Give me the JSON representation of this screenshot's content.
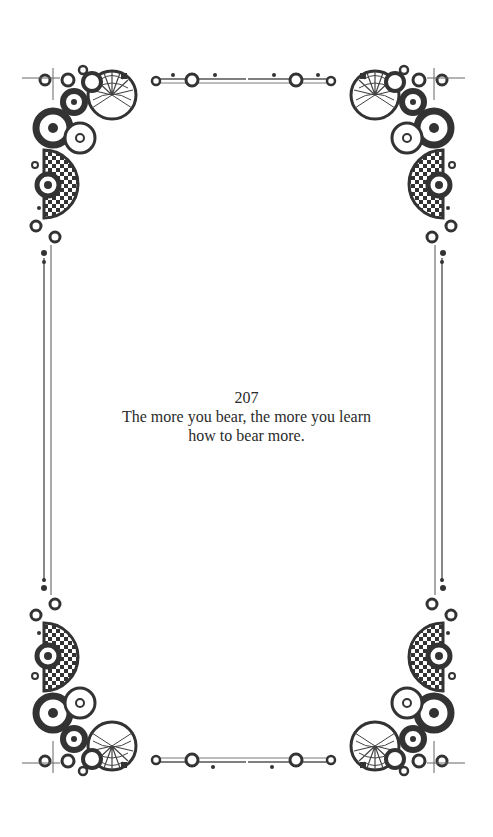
{
  "page": {
    "number": "207",
    "quote_lines": [
      "The more you bear, the more you learn",
      "how to bear more."
    ]
  },
  "frame": {
    "style": "ornamental-border",
    "ornament_color": "#3a3a3a",
    "line_color": "#555555",
    "corner_ornaments": [
      "top-left",
      "top-right",
      "bottom-left",
      "bottom-right"
    ]
  }
}
